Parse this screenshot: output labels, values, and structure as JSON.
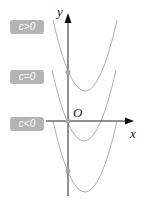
{
  "diagram": {
    "axes": {
      "x_label": "x",
      "y_label": "y",
      "origin_label": "O"
    },
    "labels": [
      {
        "id": "c-positive",
        "text": "c>0"
      },
      {
        "id": "c-zero",
        "text": "c=0"
      },
      {
        "id": "c-negative",
        "text": "c<0"
      }
    ],
    "curves": [
      {
        "name": "c>0",
        "vertex": [
          85,
          91
        ],
        "y_intercept": [
          68,
          72
        ]
      },
      {
        "name": "c=0",
        "vertex": [
          83,
          141
        ],
        "y_intercept": [
          68,
          121
        ]
      },
      {
        "name": "c<0",
        "vertex": [
          85,
          192
        ],
        "y_intercept": [
          68,
          171
        ]
      }
    ],
    "colors": {
      "curve": "#b0b0b0",
      "axis": "#222222",
      "badge": "#b4b4b4",
      "point": "#a8a8a8"
    }
  }
}
